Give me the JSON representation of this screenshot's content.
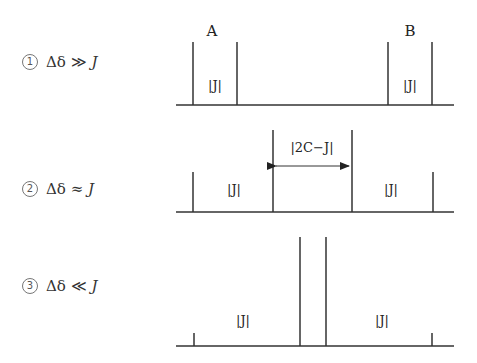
{
  "cases": [
    {
      "number": "1",
      "symbol": "Δδ",
      "relation": "≫",
      "var": "J"
    },
    {
      "number": "2",
      "symbol": "Δδ",
      "relation": "≈",
      "var": "J"
    },
    {
      "number": "3",
      "symbol": "Δδ",
      "relation": "≪",
      "var": "J"
    }
  ],
  "spectra": {
    "row1": {
      "peak_group_labels": [
        "A",
        "B"
      ],
      "coupling_labels": [
        "|J|",
        "|J|"
      ]
    },
    "row2": {
      "coupling_labels": [
        "|J|",
        "|J|"
      ],
      "arrow_label": "|2C−J|"
    },
    "row3": {
      "coupling_labels": [
        "|J|",
        "|J|"
      ]
    }
  },
  "colors": {
    "line": "#333333",
    "background": "#ffffff"
  }
}
